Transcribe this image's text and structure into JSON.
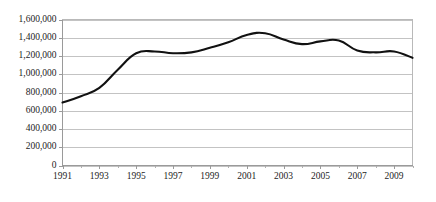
{
  "chart_data": {
    "type": "line",
    "title": "",
    "subtitle": "",
    "xlabel": "",
    "ylabel": "",
    "xlim": [
      1991,
      2010
    ],
    "ylim": [
      0,
      1600000
    ],
    "grid": true,
    "legend": false,
    "legend_position": "none",
    "line_color": "#111111",
    "gridline_color": "#c3c3c3",
    "axis_color": "#9a9a9a",
    "background_color": "#ffffff",
    "y_ticks": [
      0,
      200000,
      400000,
      600000,
      800000,
      1000000,
      1200000,
      1400000,
      1600000
    ],
    "y_tick_labels": [
      "0",
      "200,000",
      "400,000",
      "600,000",
      "800,000",
      "1,000,000",
      "1,200,000",
      "1,400,000",
      "1,600,000"
    ],
    "x_ticks": [
      1991,
      1993,
      1995,
      1997,
      1999,
      2001,
      2003,
      2005,
      2007,
      2009
    ],
    "x_tick_labels": [
      "1991",
      "1993",
      "1995",
      "1997",
      "1999",
      "2001",
      "2003",
      "2005",
      "2007",
      "2009"
    ],
    "x_minor_ticks": [
      1992,
      1994,
      1996,
      1998,
      2000,
      2002,
      2004,
      2006,
      2008,
      2010
    ],
    "x": [
      1991,
      1992,
      1993,
      1994,
      1995,
      1996,
      1997,
      1998,
      1999,
      2000,
      2001,
      2002,
      2003,
      2004,
      2005,
      2006,
      2007,
      2008,
      2009,
      2010
    ],
    "values": [
      690000,
      760000,
      850000,
      1050000,
      1230000,
      1250000,
      1230000,
      1240000,
      1290000,
      1350000,
      1430000,
      1450000,
      1380000,
      1330000,
      1360000,
      1370000,
      1260000,
      1240000,
      1250000,
      1180000
    ],
    "series": [
      {
        "name": "series-1",
        "values": [
          690000,
          760000,
          850000,
          1050000,
          1230000,
          1250000,
          1230000,
          1240000,
          1290000,
          1350000,
          1430000,
          1450000,
          1380000,
          1330000,
          1360000,
          1370000,
          1260000,
          1240000,
          1250000,
          1180000
        ]
      }
    ]
  }
}
